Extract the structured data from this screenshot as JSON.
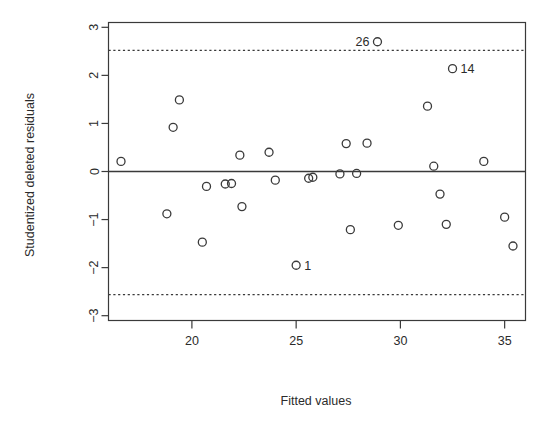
{
  "chart_data": {
    "type": "scatter",
    "title": "",
    "xlabel": "Fitted values",
    "ylabel": "Studentized deleted residuals",
    "xlim": [
      16.0,
      36.0
    ],
    "ylim": [
      -3.1,
      3.1
    ],
    "xticks": [
      20,
      25,
      30,
      35
    ],
    "yticks": [
      3,
      2,
      1,
      0,
      -1,
      -2,
      -3
    ],
    "grid": false,
    "legend": null,
    "reference_lines": [
      {
        "name": "zero-line",
        "y": 0,
        "style": "solid"
      },
      {
        "name": "upper-bound",
        "y": 2.52,
        "style": "dotted"
      },
      {
        "name": "lower-bound",
        "y": -2.56,
        "style": "dotted"
      }
    ],
    "points": [
      {
        "x": 16.6,
        "y": 0.21,
        "label": ""
      },
      {
        "x": 18.8,
        "y": -0.88,
        "label": ""
      },
      {
        "x": 19.1,
        "y": 0.92,
        "label": ""
      },
      {
        "x": 19.4,
        "y": 1.49,
        "label": ""
      },
      {
        "x": 20.5,
        "y": -1.47,
        "label": ""
      },
      {
        "x": 20.7,
        "y": -0.31,
        "label": ""
      },
      {
        "x": 21.6,
        "y": -0.26,
        "label": ""
      },
      {
        "x": 21.9,
        "y": -0.25,
        "label": ""
      },
      {
        "x": 22.3,
        "y": 0.34,
        "label": ""
      },
      {
        "x": 22.4,
        "y": -0.73,
        "label": ""
      },
      {
        "x": 23.7,
        "y": 0.4,
        "label": ""
      },
      {
        "x": 24.0,
        "y": -0.18,
        "label": ""
      },
      {
        "x": 25.0,
        "y": -1.95,
        "label": "1"
      },
      {
        "x": 25.6,
        "y": -0.14,
        "label": ""
      },
      {
        "x": 25.8,
        "y": -0.12,
        "label": ""
      },
      {
        "x": 27.1,
        "y": -0.05,
        "label": ""
      },
      {
        "x": 27.4,
        "y": 0.58,
        "label": ""
      },
      {
        "x": 27.6,
        "y": -1.21,
        "label": ""
      },
      {
        "x": 27.9,
        "y": -0.04,
        "label": ""
      },
      {
        "x": 28.4,
        "y": 0.59,
        "label": ""
      },
      {
        "x": 28.9,
        "y": 2.7,
        "label": "26"
      },
      {
        "x": 29.9,
        "y": -1.12,
        "label": ""
      },
      {
        "x": 31.3,
        "y": 1.36,
        "label": ""
      },
      {
        "x": 31.6,
        "y": 0.11,
        "label": ""
      },
      {
        "x": 31.9,
        "y": -0.47,
        "label": ""
      },
      {
        "x": 32.2,
        "y": -1.1,
        "label": ""
      },
      {
        "x": 32.5,
        "y": 2.14,
        "label": "14"
      },
      {
        "x": 34.0,
        "y": 0.21,
        "label": ""
      },
      {
        "x": 35.0,
        "y": -0.95,
        "label": ""
      },
      {
        "x": 35.4,
        "y": -1.55,
        "label": ""
      }
    ]
  },
  "axes": {
    "x_label": "Fitted values",
    "y_label": "Studentized deleted residuals",
    "x_tick_labels": [
      "20",
      "25",
      "30",
      "35"
    ],
    "y_tick_labels": [
      "3",
      "2",
      "1",
      "0",
      "-1",
      "-2",
      "-3"
    ]
  },
  "annotations": {
    "point_26": "26",
    "point_14": "14",
    "point_1": "1"
  },
  "colors": {
    "ink": "#3a3a3a",
    "text": "#2b2b2b",
    "background": "#ffffff"
  }
}
